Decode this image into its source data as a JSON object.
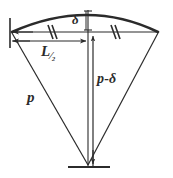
{
  "figure": {
    "type": "geometry-diagram",
    "background_color": "#ffffff",
    "line_color": "#2b2b2b",
    "labels": {
      "radius": "p",
      "radius_minus_sagitta_prefix": "p",
      "radius_minus_sagitta_operator": "-",
      "radius_minus_sagitta_suffix": "δ",
      "sagitta": "δ",
      "half_chord_letter": "L",
      "half_chord_fraction": "⁄₂"
    },
    "geometry": {
      "arc_left_end": [
        12,
        32
      ],
      "arc_right_end": [
        158,
        32
      ],
      "arc_apex": [
        88,
        12
      ],
      "center_apex": [
        88,
        165
      ],
      "chord_y": 32,
      "dimension_line_y": 41,
      "sagitta_span": [
        12,
        32
      ],
      "tick_marks": [
        {
          "name": "equal-tick-left",
          "x": 50,
          "y": 32
        },
        {
          "name": "equal-tick-right",
          "x": 113,
          "y": 32
        }
      ]
    }
  }
}
